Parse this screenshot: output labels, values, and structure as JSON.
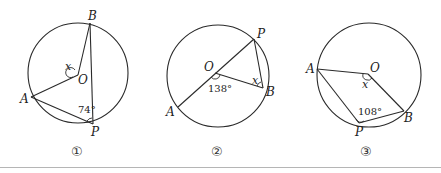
{
  "figures": [
    {
      "number_label": "①",
      "points": {
        "A": "A",
        "B": "B",
        "O": "O",
        "P": "P"
      },
      "unknown_label": "x",
      "given_angle_label": "74°",
      "given_angle_value": 74,
      "given_angle_vertex": "P",
      "unknown_angle_vertex": "O"
    },
    {
      "number_label": "②",
      "points": {
        "A": "A",
        "B": "B",
        "O": "O",
        "P": "P"
      },
      "unknown_label": "x",
      "given_angle_label": "138°",
      "given_angle_value": 138,
      "given_angle_vertex": "O",
      "unknown_angle_vertex": "B"
    },
    {
      "number_label": "③",
      "points": {
        "A": "A",
        "B": "B",
        "O": "O",
        "P": "P"
      },
      "unknown_label": "x",
      "given_angle_label": "108°",
      "given_angle_value": 108,
      "given_angle_vertex": "P",
      "unknown_angle_vertex": "O"
    }
  ]
}
